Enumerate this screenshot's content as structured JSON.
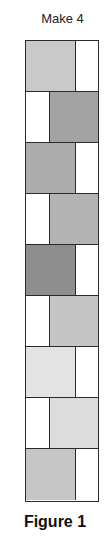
{
  "title": "Make 4",
  "caption": "Figure 1",
  "strip": {
    "rows": [
      {
        "filled_side": "left",
        "fill": "#c9c9c9",
        "other": "#ffffff"
      },
      {
        "filled_side": "right",
        "fill": "#a3a3a3",
        "other": "#ffffff"
      },
      {
        "filled_side": "left",
        "fill": "#acacac",
        "other": "#ffffff"
      },
      {
        "filled_side": "right",
        "fill": "#b3b3b3",
        "other": "#ffffff"
      },
      {
        "filled_side": "left",
        "fill": "#8e8e8e",
        "other": "#ffffff"
      },
      {
        "filled_side": "right",
        "fill": "#c5c5c5",
        "other": "#ffffff"
      },
      {
        "filled_side": "left",
        "fill": "#e3e3e3",
        "other": "#ffffff"
      },
      {
        "filled_side": "right",
        "fill": "#dcdcdc",
        "other": "#ffffff"
      },
      {
        "filled_side": "left",
        "fill": "#c6c6c6",
        "other": "#ffffff"
      }
    ]
  },
  "colors": {
    "border": "#2a2a2a",
    "text": "#222222"
  }
}
